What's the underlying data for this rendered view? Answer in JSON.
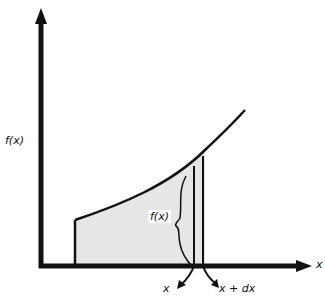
{
  "diagram": {
    "type": "integral-area-element",
    "y_axis_label": "f(x)",
    "x_axis_label": "x",
    "strip_height_label": "f(x)",
    "strip_left_label": "x",
    "strip_right_label": "x + dx",
    "colors": {
      "stroke": "#111111",
      "shade": "#e6e6e6",
      "background": "#ffffff"
    }
  }
}
